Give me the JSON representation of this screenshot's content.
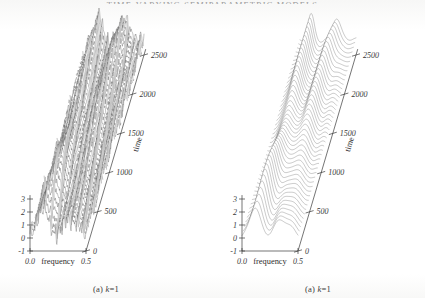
{
  "page": {
    "running_head": "TIME-VARYING SEMIPARAMETRIC MODELS",
    "folio": "",
    "background_color": "#ffffff",
    "ink_color": "#3a3a3a"
  },
  "figure": {
    "panels": [
      {
        "id": "panel-a",
        "caption_prefix": "(a)",
        "caption_symbol": "k",
        "caption_value": "=1",
        "caption_full": "(a) k=1",
        "style": "rough",
        "line_count": 46,
        "line_color": "#4a4a4a",
        "axes": {
          "x": {
            "label": "frequency",
            "ticks": [
              "0.0",
              "0.5"
            ],
            "range": [
              0.0,
              0.5
            ]
          },
          "y": {
            "label": "",
            "ticks": [
              "-1",
              "0",
              "1",
              "2",
              "3"
            ],
            "range": [
              -1,
              3
            ]
          },
          "z": {
            "label": "time",
            "ticks": [
              "0",
              "500",
              "1000",
              "1500",
              "2000",
              "2500"
            ],
            "range": [
              0,
              2500
            ]
          }
        }
      },
      {
        "id": "panel-b",
        "caption_prefix": "(a)",
        "caption_symbol": "k",
        "caption_value": "=1",
        "caption_full": "(a) k=1",
        "style": "smooth",
        "line_count": 46,
        "line_color": "#4a4a4a",
        "axes": {
          "x": {
            "label": "frequency",
            "ticks": [
              "0.0",
              "0.5"
            ],
            "range": [
              0.0,
              0.5
            ]
          },
          "y": {
            "label": "",
            "ticks": [
              "-1",
              "0",
              "1",
              "2",
              "3"
            ],
            "range": [
              -1,
              3
            ]
          },
          "z": {
            "label": "time",
            "ticks": [
              "0",
              "500",
              "1000",
              "1500",
              "2000",
              "2500"
            ],
            "range": [
              0,
              2500
            ]
          }
        }
      }
    ]
  },
  "chart_data": {
    "type": "line",
    "title": "",
    "subtitle": "",
    "variant": "3d-waterfall-ridgeline",
    "xlabel": "frequency",
    "ylabel": "",
    "zlabel": "time",
    "xlim": [
      0.0,
      0.5
    ],
    "ylim": [
      -1,
      3
    ],
    "zlim": [
      0,
      2500
    ],
    "xticks": [
      "0.0",
      "0.5"
    ],
    "yticks": [
      "-1",
      "0",
      "1",
      "2",
      "3"
    ],
    "zticks": [
      "0",
      "500",
      "1000",
      "1500",
      "2000",
      "2500"
    ],
    "grid": false,
    "legend": false,
    "legend_position": "none",
    "annotations": [
      "(a) k=1",
      "(a) k=1"
    ],
    "series_count_per_panel": 46,
    "panels": [
      {
        "name": "(a) k=1 — raw / rough estimate",
        "noise": "high",
        "description": "Dense stack of jagged spectral density curves over time; two broad modes near frequency 0.12 and 0.33 with strong high-frequency wiggle.",
        "peaks": [
          {
            "frequency": 0.12,
            "amplitude": 2.4
          },
          {
            "frequency": 0.33,
            "amplitude": 1.8
          }
        ]
      },
      {
        "name": "(a) k=1 — smoothed estimate",
        "noise": "low",
        "description": "Same 46 time slices rendered as smooth ridgelines; clean bimodal spectral peaks drifting with time.",
        "peaks": [
          {
            "frequency": 0.12,
            "amplitude": 2.6
          },
          {
            "frequency": 0.33,
            "amplitude": 1.9
          }
        ]
      }
    ]
  }
}
